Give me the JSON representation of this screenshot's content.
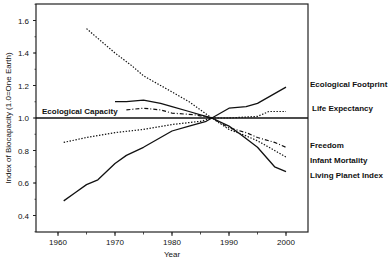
{
  "chart_data": {
    "type": "line",
    "title": "",
    "xlabel": "Year",
    "ylabel": "Index of Biocapacity (1.0=One Earth)",
    "xlim": [
      1957,
      2004
    ],
    "ylim": [
      0.3,
      1.7
    ],
    "xticks": [
      1960,
      1970,
      1980,
      1990,
      2000
    ],
    "yticks": [
      0.4,
      0.6,
      0.8,
      1.0,
      1.2,
      1.4,
      1.6
    ],
    "grid": false,
    "reference_line": {
      "label": "Ecological Capacity",
      "y": 1.0
    },
    "series": [
      {
        "name": "Ecological Footprint",
        "style": "solid",
        "x": [
          1961,
          1963,
          1965,
          1967,
          1970,
          1972,
          1975,
          1978,
          1980,
          1983,
          1986,
          1987,
          1990,
          1993,
          1995,
          1998,
          2000
        ],
        "values": [
          0.49,
          0.54,
          0.59,
          0.62,
          0.72,
          0.77,
          0.82,
          0.88,
          0.92,
          0.95,
          0.98,
          1.0,
          1.06,
          1.07,
          1.09,
          1.15,
          1.19
        ]
      },
      {
        "name": "Life Expectancy",
        "style": "dotted",
        "x": [
          1961,
          1965,
          1970,
          1975,
          1980,
          1985,
          1987,
          1990,
          1995,
          1997,
          2000
        ],
        "values": [
          0.85,
          0.88,
          0.91,
          0.93,
          0.96,
          0.98,
          1.0,
          1.0,
          1.01,
          1.04,
          1.04
        ]
      },
      {
        "name": "Freedom",
        "style": "dashdot",
        "x": [
          1972,
          1975,
          1978,
          1980,
          1984,
          1987,
          1990,
          1993,
          1995,
          1998,
          2000
        ],
        "values": [
          1.05,
          1.06,
          1.05,
          1.03,
          1.02,
          1.0,
          0.94,
          0.91,
          0.88,
          0.85,
          0.82
        ]
      },
      {
        "name": "Infant Mortality",
        "style": "dotted",
        "x": [
          1965,
          1968,
          1970,
          1973,
          1975,
          1978,
          1980,
          1983,
          1985,
          1987,
          1990,
          1993,
          1995,
          1998,
          2000
        ],
        "values": [
          1.55,
          1.46,
          1.4,
          1.32,
          1.26,
          1.2,
          1.16,
          1.1,
          1.05,
          1.0,
          0.93,
          0.89,
          0.86,
          0.8,
          0.76
        ]
      },
      {
        "name": "Living Planet Index",
        "style": "solid",
        "x": [
          1970,
          1972,
          1975,
          1978,
          1980,
          1983,
          1985,
          1987,
          1990,
          1992,
          1995,
          1997,
          1998,
          2000
        ],
        "values": [
          1.1,
          1.1,
          1.11,
          1.09,
          1.07,
          1.04,
          1.02,
          1.0,
          0.95,
          0.9,
          0.82,
          0.74,
          0.7,
          0.67
        ]
      }
    ]
  },
  "labels": {
    "xlabel": "Year",
    "ylabel": "Index of Biocapacity (1.0=One Earth)",
    "reference": "Ecological Capacity",
    "legend": [
      "Ecological Footprint",
      "Life Expectancy",
      "Freedom",
      "Infant Mortality",
      "Living Planet Index"
    ],
    "xticks": [
      "1960",
      "1970",
      "1980",
      "1990",
      "2000"
    ],
    "yticks": [
      "0.4",
      "0.6",
      "0.8",
      "1.0",
      "1.2",
      "1.4",
      "1.6"
    ]
  }
}
